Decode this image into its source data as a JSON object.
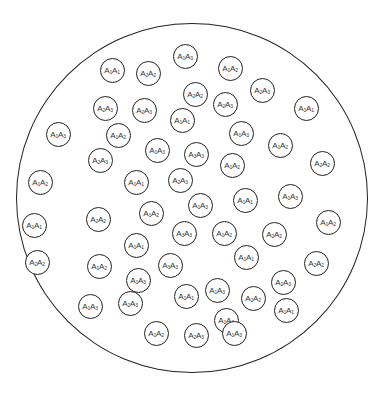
{
  "diagram": {
    "outer_circle": {
      "cx": 192,
      "cy": 198,
      "r": 175
    },
    "cells": [
      {
        "x": 185,
        "y": 56,
        "a": "1",
        "b": "3"
      },
      {
        "x": 112,
        "y": 70,
        "a": "1",
        "b": "1"
      },
      {
        "x": 148,
        "y": 73,
        "a": "2",
        "b": "2"
      },
      {
        "x": 230,
        "y": 68,
        "a": "1",
        "b": "2"
      },
      {
        "x": 195,
        "y": 94,
        "a": "2",
        "b": "2"
      },
      {
        "x": 262,
        "y": 90,
        "a": "2",
        "b": "3"
      },
      {
        "x": 105,
        "y": 108,
        "a": "2",
        "b": "3"
      },
      {
        "x": 144,
        "y": 110,
        "a": "2",
        "b": "3"
      },
      {
        "x": 225,
        "y": 104,
        "a": "2",
        "b": "3"
      },
      {
        "x": 306,
        "y": 108,
        "a": "1",
        "b": "1"
      },
      {
        "x": 182,
        "y": 120,
        "a": "1",
        "b": "1"
      },
      {
        "x": 58,
        "y": 134,
        "a": "1",
        "b": "3"
      },
      {
        "x": 118,
        "y": 135,
        "a": "1",
        "b": "2"
      },
      {
        "x": 241,
        "y": 133,
        "a": "1",
        "b": "3"
      },
      {
        "x": 280,
        "y": 145,
        "a": "1",
        "b": "2"
      },
      {
        "x": 100,
        "y": 160,
        "a": "2",
        "b": "3"
      },
      {
        "x": 157,
        "y": 150,
        "a": "1",
        "b": "3"
      },
      {
        "x": 196,
        "y": 154,
        "a": "3",
        "b": "3"
      },
      {
        "x": 232,
        "y": 165,
        "a": "1",
        "b": "2"
      },
      {
        "x": 322,
        "y": 163,
        "a": "2",
        "b": "2"
      },
      {
        "x": 40,
        "y": 182,
        "a": "1",
        "b": "2"
      },
      {
        "x": 136,
        "y": 182,
        "a": "1",
        "b": "1"
      },
      {
        "x": 180,
        "y": 180,
        "a": "2",
        "b": "3"
      },
      {
        "x": 200,
        "y": 205,
        "a": "1",
        "b": "3"
      },
      {
        "x": 245,
        "y": 200,
        "a": "1",
        "b": "1"
      },
      {
        "x": 290,
        "y": 196,
        "a": "1",
        "b": "3"
      },
      {
        "x": 34,
        "y": 225,
        "a": "1",
        "b": "1"
      },
      {
        "x": 98,
        "y": 219,
        "a": "2",
        "b": "2"
      },
      {
        "x": 151,
        "y": 213,
        "a": "1",
        "b": "2"
      },
      {
        "x": 184,
        "y": 233,
        "a": "3",
        "b": "3"
      },
      {
        "x": 224,
        "y": 233,
        "a": "1",
        "b": "2"
      },
      {
        "x": 274,
        "y": 234,
        "a": "2",
        "b": "2"
      },
      {
        "x": 328,
        "y": 222,
        "a": "1",
        "b": "2"
      },
      {
        "x": 136,
        "y": 245,
        "a": "1",
        "b": "1"
      },
      {
        "x": 37,
        "y": 262,
        "a": "2",
        "b": "2"
      },
      {
        "x": 99,
        "y": 266,
        "a": "1",
        "b": "2"
      },
      {
        "x": 170,
        "y": 265,
        "a": "3",
        "b": "3"
      },
      {
        "x": 246,
        "y": 257,
        "a": "1",
        "b": "1"
      },
      {
        "x": 316,
        "y": 263,
        "a": "2",
        "b": "2"
      },
      {
        "x": 138,
        "y": 280,
        "a": "1",
        "b": "3"
      },
      {
        "x": 217,
        "y": 290,
        "a": "1",
        "b": "3"
      },
      {
        "x": 283,
        "y": 282,
        "a": "2",
        "b": "3"
      },
      {
        "x": 186,
        "y": 296,
        "a": "1",
        "b": "1"
      },
      {
        "x": 90,
        "y": 306,
        "a": "1",
        "b": "3"
      },
      {
        "x": 130,
        "y": 303,
        "a": "2",
        "b": "3"
      },
      {
        "x": 253,
        "y": 298,
        "a": "2",
        "b": "2"
      },
      {
        "x": 226,
        "y": 320,
        "a": "1",
        "b": "3"
      },
      {
        "x": 286,
        "y": 310,
        "a": "1",
        "b": "1"
      },
      {
        "x": 156,
        "y": 333,
        "a": "1",
        "b": "2"
      },
      {
        "x": 196,
        "y": 335,
        "a": "2",
        "b": "3"
      },
      {
        "x": 234,
        "y": 333,
        "a": "1",
        "b": "3"
      }
    ]
  }
}
